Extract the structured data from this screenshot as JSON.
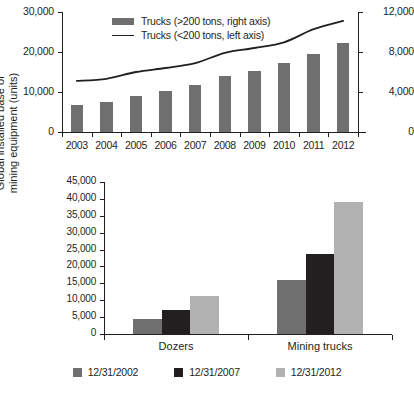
{
  "chart_data": [
    {
      "id": "top",
      "type": "bar",
      "title": "",
      "xlabel": "",
      "ylabel": "",
      "grid": false,
      "legend_position": "top-left",
      "categories": [
        "2003",
        "2004",
        "2005",
        "2006",
        "2007",
        "2008",
        "2009",
        "2010",
        "2011",
        "2012"
      ],
      "left_axis": {
        "ticks": [
          "0",
          "10,000",
          "20,000",
          "30,000"
        ],
        "tick_values": [
          0,
          10000,
          20000,
          30000
        ],
        "ylim": [
          0,
          30000
        ]
      },
      "right_axis": {
        "ticks": [
          "0",
          "4,000",
          "8,000",
          "12,000"
        ],
        "tick_values": [
          0,
          4000,
          8000,
          12000
        ],
        "ylim": [
          0,
          12000
        ]
      },
      "series": [
        {
          "name": "Trucks (>200 tons, right axis)",
          "kind": "bar",
          "axis": "right",
          "color": "#6f6f6f",
          "values": [
            2700,
            3050,
            3600,
            4100,
            4750,
            5600,
            6150,
            6950,
            7850,
            8950
          ]
        },
        {
          "name": "Trucks (<200 tons, left axis)",
          "kind": "line",
          "axis": "left",
          "color": "#231f20",
          "values": [
            12800,
            13300,
            15000,
            16000,
            17200,
            19800,
            21000,
            22400,
            25700,
            27800
          ]
        }
      ]
    },
    {
      "id": "bottom",
      "type": "bar",
      "title": "",
      "xlabel": "",
      "ylabel": "Global installed base of mining equipment (units)",
      "grid": false,
      "legend_position": "bottom",
      "categories": [
        "Dozers",
        "Mining trucks"
      ],
      "ylim": [
        0,
        45000
      ],
      "yticks": [
        "0",
        "5,000",
        "10,000",
        "15,000",
        "20,000",
        "25,000",
        "30,000",
        "35,000",
        "40,000",
        "45,000"
      ],
      "ytick_values": [
        0,
        5000,
        10000,
        15000,
        20000,
        25000,
        30000,
        35000,
        40000,
        45000
      ],
      "series": [
        {
          "name": "12/31/2002",
          "color": "#6f6f6f",
          "values": [
            4500,
            16000
          ]
        },
        {
          "name": "12/31/2007",
          "color": "#211f1f",
          "values": [
            7200,
            23800
          ]
        },
        {
          "name": "12/31/2012",
          "color": "#b1b1b1",
          "values": [
            11200,
            39000
          ]
        }
      ]
    }
  ],
  "top": {
    "legend": [
      {
        "label": "Trucks (>200 tons, right axis)",
        "marker": "bar"
      },
      {
        "label": "Trucks (<200 tons, left axis)",
        "marker": "line"
      }
    ]
  },
  "bottom": {
    "axis_title": "Global installed base of",
    "axis_title2": "mining equipment (units)"
  }
}
